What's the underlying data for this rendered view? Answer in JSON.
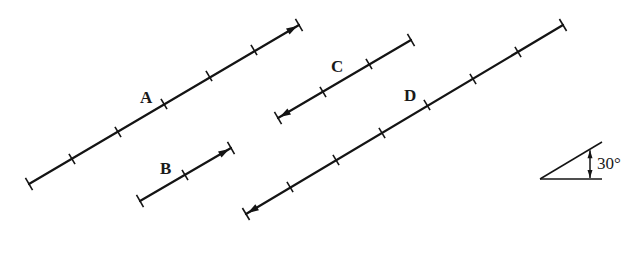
{
  "diagram": {
    "colors": {
      "line": "#141414",
      "background": "#ffffff"
    },
    "vectors": [
      {
        "label": "A",
        "start": [
          29,
          184
        ],
        "end": [
          299,
          25
        ],
        "arrow": "end",
        "ticks": [
          [
            72,
            159
          ],
          [
            118,
            132
          ],
          [
            164,
            104
          ],
          [
            209,
            76
          ],
          [
            254,
            50
          ]
        ],
        "label_pos": [
          140,
          103
        ],
        "units": 6
      },
      {
        "label": "B",
        "start": [
          140,
          201
        ],
        "end": [
          231,
          148
        ],
        "arrow": "end",
        "ticks": [
          [
            185,
            175
          ]
        ],
        "label_pos": [
          160,
          174
        ],
        "units": 2
      },
      {
        "label": "C",
        "start": [
          278,
          118
        ],
        "end": [
          411,
          40
        ],
        "arrow": "start",
        "ticks": [
          [
            323,
            92
          ],
          [
            369,
            64
          ]
        ],
        "label_pos": [
          331,
          72
        ],
        "units": 3
      },
      {
        "label": "D",
        "start": [
          246,
          214
        ],
        "end": [
          563,
          25
        ],
        "arrow": "start",
        "ticks": [
          [
            290,
            187
          ],
          [
            336,
            160
          ],
          [
            382,
            133
          ],
          [
            427,
            105
          ],
          [
            473,
            79
          ],
          [
            518,
            52
          ]
        ],
        "label_pos": [
          404,
          101
        ],
        "units": 7
      }
    ],
    "angle_indicator": {
      "text": "30°",
      "vertex": [
        540,
        179
      ],
      "base_end": [
        602,
        179
      ],
      "slant_end": [
        602,
        142
      ],
      "marker_x": 590,
      "text_pos": [
        597,
        169
      ]
    }
  }
}
